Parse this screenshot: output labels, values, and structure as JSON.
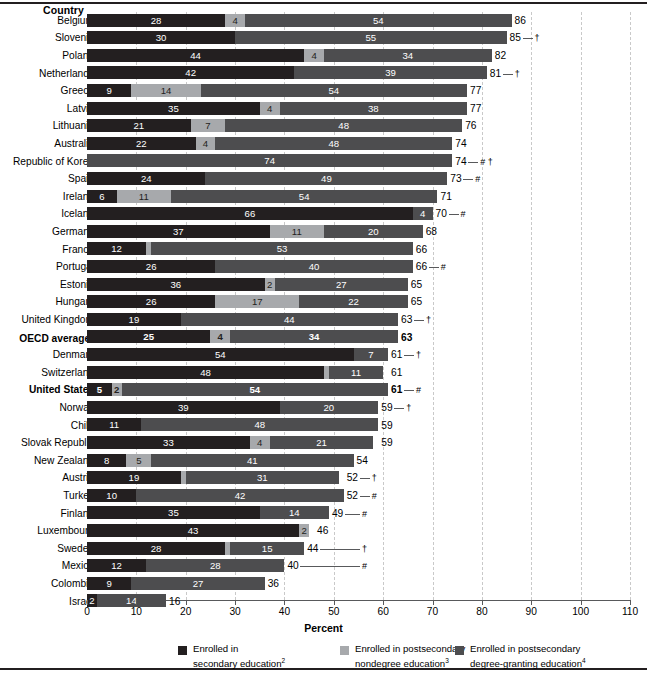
{
  "chart_data": {
    "type": "bar",
    "orientation": "horizontal",
    "stacked": true,
    "title": "",
    "xlabel": "Percent",
    "ylabel": "Country",
    "xlim": [
      0,
      110
    ],
    "xticks": [
      0,
      10,
      20,
      30,
      40,
      50,
      60,
      70,
      80,
      90,
      100,
      110
    ],
    "grid": "vertical-dashed",
    "legend_position": "bottom",
    "series": [
      {
        "name": "Enrolled in secondary education",
        "footnote": "2",
        "color": "#231f20",
        "key": "secondary"
      },
      {
        "name": "Enrolled in postsecondary nondegree education",
        "footnote": "3",
        "color": "#a7a9ac",
        "key": "nondegree"
      },
      {
        "name": "Enrolled in postsecondary degree-granting education",
        "footnote": "4",
        "color": "#4d4d4f",
        "key": "degree"
      }
    ],
    "categories": [
      "Belgium",
      "Slovenia",
      "Poland",
      "Netherlands",
      "Greece",
      "Latvia",
      "Lithuania",
      "Australia",
      "Republic of Korea",
      "Spain",
      "Ireland",
      "Iceland",
      "Germany",
      "France",
      "Portugal",
      "Estonia",
      "Hungary",
      "United Kingdom",
      "OECD average",
      "Denmark",
      "Switzerland",
      "United States",
      "Norway",
      "Chile",
      "Slovak Republic",
      "New Zealand",
      "Austria",
      "Turkey",
      "Finland",
      "Luxembourg",
      "Sweden",
      "Mexico",
      "Colombia",
      "Israel"
    ],
    "rows": [
      {
        "country": "Belgium",
        "secondary": 28,
        "nondegree": 4,
        "degree": 54,
        "total": 86,
        "flag": "",
        "label_sec": "28",
        "label_non": "4",
        "label_deg": "54"
      },
      {
        "country": "Slovenia",
        "secondary": 30,
        "nondegree": 0,
        "degree": 55,
        "total": 85,
        "flag": "†",
        "label_sec": "30",
        "label_non": "",
        "label_deg": "55"
      },
      {
        "country": "Poland",
        "secondary": 44,
        "nondegree": 4,
        "degree": 34,
        "total": 82,
        "flag": "",
        "label_sec": "44",
        "label_non": "4",
        "label_deg": "34"
      },
      {
        "country": "Netherlands",
        "secondary": 42,
        "nondegree": 0,
        "degree": 39,
        "total": 81,
        "flag": "†",
        "label_sec": "42",
        "label_non": "",
        "label_deg": "39"
      },
      {
        "country": "Greece",
        "secondary": 9,
        "nondegree": 14,
        "degree": 54,
        "total": 77,
        "flag": "",
        "label_sec": "9",
        "label_non": "14",
        "label_deg": "54"
      },
      {
        "country": "Latvia",
        "secondary": 35,
        "nondegree": 4,
        "degree": 38,
        "total": 77,
        "flag": "",
        "label_sec": "35",
        "label_non": "4",
        "label_deg": "38"
      },
      {
        "country": "Lithuania",
        "secondary": 21,
        "nondegree": 7,
        "degree": 48,
        "total": 76,
        "flag": "",
        "label_sec": "21",
        "label_non": "7",
        "label_deg": "48"
      },
      {
        "country": "Australia",
        "secondary": 22,
        "nondegree": 4,
        "degree": 48,
        "total": 74,
        "flag": "",
        "label_sec": "22",
        "label_non": "4",
        "label_deg": "48"
      },
      {
        "country": "Republic of Korea",
        "secondary": 0,
        "nondegree": 0,
        "degree": 74,
        "total": 74,
        "flag": "# †",
        "label_sec": "",
        "label_non": "",
        "label_deg": "74"
      },
      {
        "country": "Spain",
        "secondary": 24,
        "nondegree": 0,
        "degree": 49,
        "total": 73,
        "flag": "#",
        "label_sec": "24",
        "label_non": "",
        "label_deg": "49"
      },
      {
        "country": "Ireland",
        "secondary": 6,
        "nondegree": 11,
        "degree": 54,
        "total": 71,
        "flag": "",
        "label_sec": "6",
        "label_non": "11",
        "label_deg": "54"
      },
      {
        "country": "Iceland",
        "secondary": 66,
        "nondegree": 0,
        "degree": 4,
        "total": 70,
        "flag": "#",
        "label_sec": "66",
        "label_non": "",
        "label_deg": "4"
      },
      {
        "country": "Germany",
        "secondary": 37,
        "nondegree": 11,
        "degree": 20,
        "total": 68,
        "flag": "",
        "label_sec": "37",
        "label_non": "11",
        "label_deg": "20"
      },
      {
        "country": "France",
        "secondary": 12,
        "nondegree": 1,
        "degree": 53,
        "total": 66,
        "flag": "",
        "label_sec": "12",
        "label_non": "",
        "label_deg": "53"
      },
      {
        "country": "Portugal",
        "secondary": 26,
        "nondegree": 0,
        "degree": 40,
        "total": 66,
        "flag": "#",
        "label_sec": "26",
        "label_non": "",
        "label_deg": "40"
      },
      {
        "country": "Estonia",
        "secondary": 36,
        "nondegree": 2,
        "degree": 27,
        "total": 65,
        "flag": "",
        "label_sec": "36",
        "label_non": "2",
        "label_deg": "27"
      },
      {
        "country": "Hungary",
        "secondary": 26,
        "nondegree": 17,
        "degree": 22,
        "total": 65,
        "flag": "",
        "label_sec": "26",
        "label_non": "17",
        "label_deg": "22"
      },
      {
        "country": "United Kingdom",
        "secondary": 19,
        "nondegree": 0,
        "degree": 44,
        "total": 63,
        "flag": "†",
        "label_sec": "19",
        "label_non": "",
        "label_deg": "44"
      },
      {
        "country": "OECD average",
        "footnote": "1",
        "bold": true,
        "secondary": 25,
        "nondegree": 4,
        "degree": 34,
        "total": 63,
        "flag": "",
        "label_sec": "25",
        "label_non": "4",
        "label_deg": "34"
      },
      {
        "country": "Denmark",
        "secondary": 54,
        "nondegree": 0,
        "degree": 7,
        "total": 61,
        "flag": "†",
        "label_sec": "54",
        "label_non": "",
        "label_deg": "7"
      },
      {
        "country": "Switzerland",
        "secondary": 48,
        "nondegree": 1,
        "degree": 11,
        "total": 61,
        "flag": "",
        "label_sec": "48",
        "label_non": "",
        "label_deg": "11"
      },
      {
        "country": "United States",
        "bold": true,
        "secondary": 5,
        "nondegree": 2,
        "degree": 54,
        "total": 61,
        "flag": "#",
        "label_sec": "5",
        "label_non": "2",
        "label_deg": "54"
      },
      {
        "country": "Norway",
        "secondary": 39,
        "nondegree": 0,
        "degree": 20,
        "total": 59,
        "flag": "†",
        "label_sec": "39",
        "label_non": "",
        "label_deg": "20"
      },
      {
        "country": "Chile",
        "secondary": 11,
        "nondegree": 0,
        "degree": 48,
        "total": 59,
        "flag": "",
        "label_sec": "11",
        "label_non": "",
        "label_deg": "48"
      },
      {
        "country": "Slovak Republic",
        "secondary": 33,
        "nondegree": 4,
        "degree": 21,
        "total": 59,
        "flag": "",
        "label_sec": "33",
        "label_non": "4",
        "label_deg": "21"
      },
      {
        "country": "New Zealand",
        "secondary": 8,
        "nondegree": 5,
        "degree": 41,
        "total": 54,
        "flag": "",
        "label_sec": "8",
        "label_non": "5",
        "label_deg": "41"
      },
      {
        "country": "Austria",
        "secondary": 19,
        "nondegree": 1,
        "degree": 31,
        "total": 52,
        "flag": "†",
        "label_sec": "19",
        "label_non": "",
        "label_deg": "31"
      },
      {
        "country": "Turkey",
        "secondary": 10,
        "nondegree": 0,
        "degree": 42,
        "total": 52,
        "flag": "#",
        "label_sec": "10",
        "label_non": "",
        "label_deg": "42"
      },
      {
        "country": "Finland",
        "secondary": 35,
        "nondegree": 0,
        "degree": 14,
        "total": 49,
        "flag": "#",
        "label_sec": "35",
        "label_non": "",
        "label_deg": "14"
      },
      {
        "country": "Luxembourg",
        "secondary": 43,
        "nondegree": 2,
        "degree": 0,
        "total": 46,
        "flag": "",
        "label_sec": "43",
        "label_non": "2",
        "label_deg": ""
      },
      {
        "country": "Sweden",
        "secondary": 28,
        "nondegree": 1,
        "degree": 15,
        "total": 44,
        "flag": "†",
        "label_sec": "28",
        "label_non": "",
        "label_deg": "15"
      },
      {
        "country": "Mexico",
        "secondary": 12,
        "nondegree": 0,
        "degree": 28,
        "total": 40,
        "flag": "#",
        "label_sec": "12",
        "label_non": "",
        "label_deg": "28"
      },
      {
        "country": "Colombia",
        "secondary": 9,
        "nondegree": 0,
        "degree": 27,
        "total": 36,
        "flag": "",
        "label_sec": "9",
        "label_non": "",
        "label_deg": "27"
      },
      {
        "country": "Israel",
        "secondary": 2,
        "nondegree": 0,
        "degree": 14,
        "total": 16,
        "flag": "",
        "label_sec": "2",
        "label_non": "",
        "label_deg": "14"
      }
    ]
  },
  "axis": {
    "y_header": "Country",
    "x_title": "Percent",
    "x_tick_labels": [
      "0",
      "10",
      "20",
      "30",
      "40",
      "50",
      "60",
      "70",
      "80",
      "90",
      "100",
      "110"
    ]
  },
  "legend": {
    "items": [
      {
        "line1": "Enrolled in",
        "line2": "secondary education",
        "sup": "2",
        "color": "#231f20",
        "swatch": "legend-swatch-secondary"
      },
      {
        "line1": "Enrolled in postsecondary",
        "line2": "nondegree education",
        "sup": "3",
        "color": "#a7a9ac",
        "swatch": "legend-swatch-nondegree"
      },
      {
        "line1": "Enrolled in postsecondary",
        "line2": "degree-granting education",
        "sup": "4",
        "color": "#4d4d4f",
        "swatch": "legend-swatch-degree"
      }
    ]
  },
  "colors": {
    "secondary": "#231f20",
    "nondegree": "#a7a9ac",
    "degree": "#4d4d4f",
    "grid": "#c9c9c9",
    "axis": "#58595b"
  }
}
